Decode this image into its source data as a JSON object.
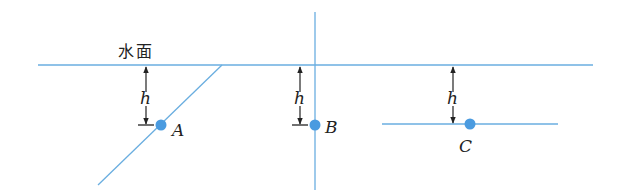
{
  "diagram": {
    "water_surface_label": "水面",
    "depth_label": "h",
    "points": [
      {
        "id": "A",
        "label": "A",
        "surface_orientation": "inclined"
      },
      {
        "id": "B",
        "label": "B",
        "surface_orientation": "vertical"
      },
      {
        "id": "C",
        "label": "C",
        "surface_orientation": "horizontal"
      }
    ],
    "colors": {
      "line": "#6aaee0",
      "point": "#4a9be0",
      "text": "#222222",
      "background": "#ffffff"
    }
  }
}
